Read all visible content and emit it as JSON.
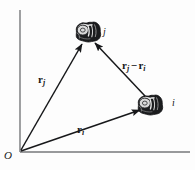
{
  "figure": {
    "type": "vector-diagram",
    "background_color": "#fdfdfd",
    "ink_color": "#17181a"
  },
  "axes": {
    "origin_label": "O",
    "vertical_axis": {
      "x": 20,
      "y_top": 10,
      "y_bottom": 152
    },
    "horizontal_axis": {
      "y": 152,
      "x_left": 20,
      "x_right": 190
    }
  },
  "nodes": [
    {
      "id": "j",
      "label": "j",
      "cx": 88,
      "cy": 32,
      "rx": 13,
      "ry": 10,
      "label_x": 103,
      "label_y": 27
    },
    {
      "id": "i",
      "label": "i",
      "cx": 150,
      "cy": 105,
      "rx": 13,
      "ry": 10,
      "label_x": 172,
      "label_y": 98
    }
  ],
  "vectors": [
    {
      "id": "r_j",
      "symbol": "r",
      "subscript": "j",
      "operator": "",
      "symbol2": "",
      "subscript2": "",
      "from": "O",
      "to": "j",
      "x1": 21,
      "y1": 150,
      "x2": 82,
      "y2": 44,
      "label_x": 38,
      "label_y": 74
    },
    {
      "id": "r_i",
      "symbol": "r",
      "subscript": "i",
      "operator": "",
      "symbol2": "",
      "subscript2": "",
      "from": "O",
      "to": "i",
      "x1": 21,
      "y1": 151,
      "x2": 140,
      "y2": 110,
      "label_x": 77,
      "label_y": 124
    },
    {
      "id": "r_j_minus_r_i",
      "symbol": "r",
      "subscript": "j",
      "operator": "−",
      "symbol2": "r",
      "subscript2": "i",
      "from": "i",
      "to": "j",
      "x1": 145,
      "y1": 96,
      "x2": 95,
      "y2": 43,
      "label_x": 122,
      "label_y": 60
    }
  ]
}
